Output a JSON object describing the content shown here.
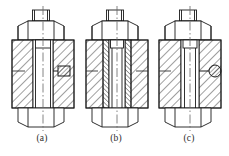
{
  "sheet": {
    "title": "Bolted joint sectional views",
    "background": "#ffffff",
    "line_color": "#1a1a1a",
    "hatch_color": "#2b2b2b",
    "centerline_color": "#555555"
  },
  "figures": [
    {
      "id": "a",
      "caption": "(a)",
      "description": "Bolted joint cross-section with square locating key on right flank",
      "detail_feature": "square-key",
      "parts": [
        "top-hex-nut",
        "stud-thread-end",
        "upper-plate-block-left",
        "upper-plate-block-right",
        "central-bolt-shank",
        "lower-hex-nut",
        "square-key-detail"
      ]
    },
    {
      "id": "b",
      "caption": "(b)",
      "description": "Bolted joint cross-section with cross-hatched sleeve bushings flanking the bore",
      "detail_feature": "sleeve-bushing",
      "parts": [
        "top-hex-nut",
        "stud-thread-end",
        "plate-block-left",
        "plate-block-right",
        "bushing-left",
        "bushing-right",
        "central-bolt-shank",
        "lower-hex-nut"
      ]
    },
    {
      "id": "c",
      "caption": "(c)",
      "description": "Bolted joint cross-section with circular ball detent on right flank",
      "detail_feature": "ball-detent",
      "parts": [
        "top-hex-nut",
        "stud-thread-end",
        "plate-block-left",
        "plate-block-right",
        "central-bolt-shank",
        "lower-hex-nut",
        "ball-detent-circle"
      ]
    }
  ]
}
